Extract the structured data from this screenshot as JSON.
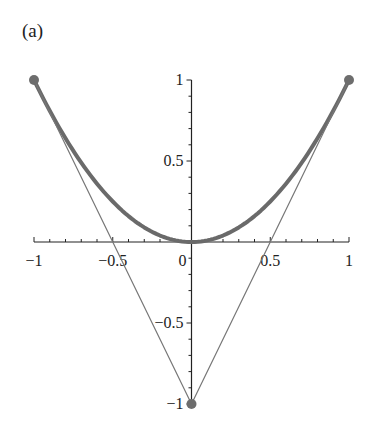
{
  "panel_label": "(a)",
  "colors": {
    "curve": "#6a6a6a",
    "control_polygon": "#777777",
    "control_points": "#6d6d6d",
    "axes": "#222222"
  },
  "chart_data": {
    "type": "line",
    "title": "",
    "panel": "(a)",
    "xlabel": "",
    "ylabel": "",
    "xlim": [
      -1,
      1
    ],
    "ylim": [
      -1,
      1
    ],
    "grid": false,
    "legend": null,
    "x_ticks": [
      "-1",
      "-0.5",
      "0",
      "0.5",
      "1"
    ],
    "y_ticks": [
      "1",
      "0.5",
      "-0.5",
      "-1"
    ],
    "series": [
      {
        "name": "quadratic Bezier curve (y = x^2)",
        "style": "thick",
        "x": [
          -1,
          -0.75,
          -0.5,
          -0.25,
          0,
          0.25,
          0.5,
          0.75,
          1
        ],
        "y": [
          1,
          0.5625,
          0.25,
          0.0625,
          0,
          0.0625,
          0.25,
          0.5625,
          1
        ]
      },
      {
        "name": "control polygon",
        "style": "thin",
        "x": [
          -1,
          0,
          1
        ],
        "y": [
          1,
          -1,
          1
        ]
      }
    ],
    "control_points": [
      {
        "x": -1,
        "y": 1
      },
      {
        "x": 0,
        "y": -1
      },
      {
        "x": 1,
        "y": 1
      }
    ]
  }
}
